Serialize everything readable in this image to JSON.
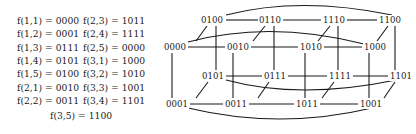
{
  "mapping": {
    "column1": [
      "f(1,1) = 0000",
      "f(1,2) = 0001",
      "f(1,3) = 0111",
      "f(1,4) = 0101",
      "f(1,5) = 0100",
      "f(2,1) = 0010",
      "f(2,2) = 0011"
    ],
    "column2": [
      "f(2,3) = 1011",
      "f(2,4) = 1111",
      "f(2,5) = 0000",
      "f(3,1) = 1000",
      "f(3,2) = 1010",
      "f(3,3) = 1001",
      "f(3,4) = 1101"
    ],
    "last": "f(3,5) = 1100"
  },
  "graph": {
    "nodes": {
      "n0100": "0100",
      "n0110": "0110",
      "n1110": "1110",
      "n1100": "1100",
      "n0000": "0000",
      "n0010": "0010",
      "n1010": "1010",
      "n1000": "1000",
      "n0101": "0101",
      "n0111": "0111",
      "n1111": "1111",
      "n1101": "1101",
      "n0001": "0001",
      "n0011": "0011",
      "n1011": "1011",
      "n1001": "1001"
    }
  }
}
